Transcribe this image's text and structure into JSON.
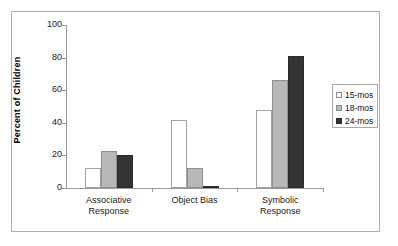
{
  "chart_data": {
    "type": "bar",
    "title": "",
    "subtitle": "",
    "xlabel": "",
    "ylabel": "Percent of Children",
    "ylim": [
      0,
      100
    ],
    "yticks": [
      0,
      20,
      40,
      60,
      80,
      100
    ],
    "ytick_labels": [
      "0",
      "20",
      "40",
      "60",
      "80",
      "100"
    ],
    "grid": false,
    "legend_position": "right",
    "categories": [
      "Associative Response",
      "Object Bias",
      "Symbolic Response"
    ],
    "category_lines": [
      [
        "Associative",
        "Response"
      ],
      [
        "Object Bias",
        ""
      ],
      [
        "Symbolic",
        "Response"
      ]
    ],
    "series": [
      {
        "name": "15-mos",
        "color": "#ffffff",
        "values": [
          12,
          41.5,
          48
        ]
      },
      {
        "name": "18-mos",
        "color": "#b8b8b8",
        "values": [
          23,
          12.5,
          66
        ]
      },
      {
        "name": "24-mos",
        "color": "#333333",
        "values": [
          20.5,
          1,
          81
        ]
      }
    ]
  },
  "legend": {
    "items": [
      {
        "label": "15-mos"
      },
      {
        "label": "18-mos"
      },
      {
        "label": "24-mos"
      }
    ]
  }
}
